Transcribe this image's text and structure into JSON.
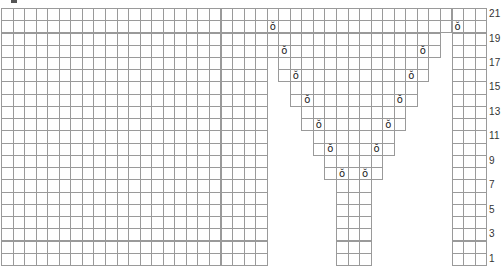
{
  "chart_data": {
    "type": "knitting-chart",
    "title": "",
    "grid": {
      "columns": 42,
      "rows": 21,
      "origin_x": 1,
      "origin_y": 8,
      "cell_width": 11.55,
      "cell_height": 12.24,
      "line_color": "#9a9a9a"
    },
    "row_labels": [
      "21",
      "19",
      "17",
      "15",
      "13",
      "11",
      "9",
      "7",
      "5",
      "3",
      "1"
    ],
    "row_label_rows": [
      21,
      19,
      17,
      15,
      13,
      11,
      9,
      7,
      5,
      3,
      1
    ],
    "shape_by_row": [
      {
        "rows": [
          20,
          21
        ],
        "segments": [
          [
            0,
            41
          ]
        ]
      },
      {
        "rows": [
          18,
          19
        ],
        "segments": [
          [
            0,
            22
          ],
          [
            23,
            37
          ],
          [
            39,
            41
          ]
        ]
      },
      {
        "rows": [
          16,
          17
        ],
        "segments": [
          [
            0,
            22
          ],
          [
            24,
            36
          ],
          [
            39,
            41
          ]
        ]
      },
      {
        "rows": [
          14,
          15
        ],
        "segments": [
          [
            0,
            22
          ],
          [
            25,
            35
          ],
          [
            39,
            41
          ]
        ]
      },
      {
        "rows": [
          12,
          13
        ],
        "segments": [
          [
            0,
            22
          ],
          [
            26,
            34
          ],
          [
            39,
            41
          ]
        ]
      },
      {
        "rows": [
          10,
          11
        ],
        "segments": [
          [
            0,
            22
          ],
          [
            27,
            33
          ],
          [
            39,
            41
          ]
        ]
      },
      {
        "rows": [
          8,
          9
        ],
        "segments": [
          [
            0,
            22
          ],
          [
            28,
            32
          ],
          [
            39,
            41
          ]
        ]
      },
      {
        "rows": [
          1,
          2,
          3,
          4,
          5,
          6,
          7
        ],
        "segments": [
          [
            0,
            22
          ],
          [
            29,
            31
          ],
          [
            39,
            41
          ]
        ]
      }
    ],
    "symbols": [
      {
        "symbol": "yarn-over",
        "glyph": "ŏ",
        "row": 20,
        "col": 23
      },
      {
        "symbol": "yarn-over",
        "glyph": "ŏ",
        "row": 20,
        "col": 39
      },
      {
        "symbol": "yarn-over",
        "glyph": "ŏ",
        "row": 18,
        "col": 24
      },
      {
        "symbol": "yarn-over",
        "glyph": "ŏ",
        "row": 18,
        "col": 36
      },
      {
        "symbol": "yarn-over",
        "glyph": "ŏ",
        "row": 16,
        "col": 25
      },
      {
        "symbol": "yarn-over",
        "glyph": "ŏ",
        "row": 16,
        "col": 35
      },
      {
        "symbol": "yarn-over",
        "glyph": "ŏ",
        "row": 14,
        "col": 26
      },
      {
        "symbol": "yarn-over",
        "glyph": "ŏ",
        "row": 14,
        "col": 34
      },
      {
        "symbol": "yarn-over",
        "glyph": "ŏ",
        "row": 12,
        "col": 27
      },
      {
        "symbol": "yarn-over",
        "glyph": "ŏ",
        "row": 12,
        "col": 33
      },
      {
        "symbol": "yarn-over",
        "glyph": "ŏ",
        "row": 10,
        "col": 28
      },
      {
        "symbol": "yarn-over",
        "glyph": "ŏ",
        "row": 10,
        "col": 32
      },
      {
        "symbol": "yarn-over",
        "glyph": "ŏ",
        "row": 8,
        "col": 29
      },
      {
        "symbol": "yarn-over",
        "glyph": "ŏ",
        "row": 8,
        "col": 31
      }
    ]
  }
}
